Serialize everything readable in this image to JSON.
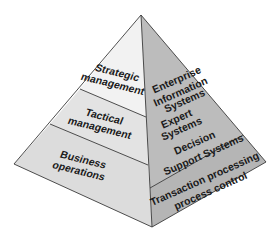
{
  "diagram": {
    "type": "pyramid",
    "left_face": {
      "layers": [
        {
          "line1": "Strategic",
          "line2": "management"
        },
        {
          "line1": "Tactical",
          "line2": "management"
        },
        {
          "line1": "Business",
          "line2": "operations"
        }
      ]
    },
    "right_face": {
      "upper": {
        "lines": [
          "Enterprise",
          "Information",
          "Systems",
          "Expert",
          "Systems",
          "Decision",
          "Support Systems"
        ]
      },
      "lower": {
        "lines": [
          "Transaction processing",
          "process control"
        ]
      }
    },
    "colors": {
      "left_top": "#f2f2f2",
      "left_middle": "#e2e2e2",
      "left_bottom": "#dcdcdc",
      "right_face": "#b9b9b9",
      "edge": "#3a3a3a",
      "text": "#1a1a1a"
    }
  }
}
